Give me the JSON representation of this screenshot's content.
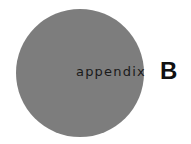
{
  "heading": {
    "label": "appendix",
    "letter": "B"
  },
  "colors": {
    "circle": "#7d7d7d",
    "text": "#1a1a1a",
    "background": "#ffffff"
  }
}
